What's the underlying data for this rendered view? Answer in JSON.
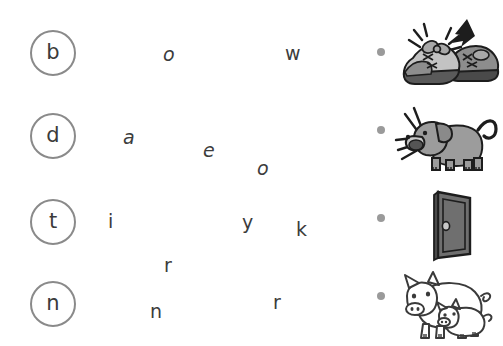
{
  "worksheet": {
    "title": "Beginning sound matching worksheet",
    "background_color": "#ffffff",
    "circle_border_color": "#8a8a8a",
    "letter_color": "#3c3c3c",
    "bullet_color": "#9a9a9a"
  },
  "rows": [
    {
      "circle_letter": "b",
      "scattered_letters": [
        "o",
        "w"
      ],
      "picture_name": "shoes-with-bow",
      "picture_caption": "pair of sneakers with laces tied in a bow",
      "bullet": "•"
    },
    {
      "circle_letter": "d",
      "scattered_letters": [
        "a",
        "e",
        "o"
      ],
      "picture_name": "barking-dog",
      "picture_caption": "dog barking",
      "bullet": "•"
    },
    {
      "circle_letter": "t",
      "scattered_letters": [
        "i",
        "y",
        "k"
      ],
      "picture_name": "door",
      "picture_caption": "open door",
      "bullet": "•"
    },
    {
      "circle_letter": "n",
      "scattered_letters": [
        "r",
        "n",
        "r"
      ],
      "picture_name": "pigs",
      "picture_caption": "pig and piglet",
      "bullet": "•"
    }
  ],
  "scatter_field": {
    "letters": [
      {
        "char": "o",
        "row": 1
      },
      {
        "char": "w",
        "row": 1
      },
      {
        "char": "a",
        "row": 2
      },
      {
        "char": "e",
        "row": 2
      },
      {
        "char": "o",
        "row": 2
      },
      {
        "char": "i",
        "row": 3
      },
      {
        "char": "y",
        "row": 3
      },
      {
        "char": "k",
        "row": 3
      },
      {
        "char": "r",
        "row": 4
      },
      {
        "char": "n",
        "row": 4
      },
      {
        "char": "r",
        "row": 4
      }
    ]
  }
}
